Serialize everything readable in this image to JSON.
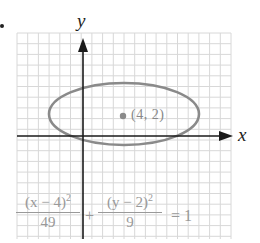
{
  "figure": {
    "axes": {
      "x_label": "x",
      "y_label": "y"
    },
    "center": {
      "label": "(4, 2)",
      "x": 4,
      "y": 2
    },
    "ellipse": {
      "h": 4,
      "k": 2,
      "a_squared": 49,
      "b_squared": 9
    },
    "equation": {
      "term1_numerator": "(x − 4)",
      "term1_exponent": "2",
      "term1_denominator": "49",
      "plus": "+",
      "term2_numerator": "(y − 2)",
      "term2_exponent": "2",
      "term2_denominator": "9",
      "equals": "= 1"
    },
    "colors": {
      "grid": "#d8d8d8",
      "axis": "#1a1a1a",
      "ellipse": "#8a8a8a",
      "equation_text": "#999999"
    }
  }
}
